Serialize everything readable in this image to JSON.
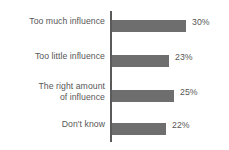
{
  "chart_data": {
    "type": "bar",
    "orientation": "horizontal",
    "title": "",
    "subtitle": "",
    "xlabel": "",
    "ylabel": "",
    "categories": [
      "Too much influence",
      "Too little influence",
      "The right amount\nof influence",
      "Don't know"
    ],
    "values": [
      30,
      23,
      25,
      22
    ],
    "value_labels": [
      "30%",
      "23%",
      "25%",
      "22%"
    ],
    "units": "percent",
    "xlim": [
      0,
      30
    ],
    "grid": false,
    "legend": false,
    "axis": {
      "category_axis": "vertical-left",
      "tick_labels_shown": false
    },
    "colors": {
      "bar": "#6e6e6e",
      "axis": "#5a5a5a",
      "text": "#575757",
      "background": "#ffffff"
    }
  }
}
